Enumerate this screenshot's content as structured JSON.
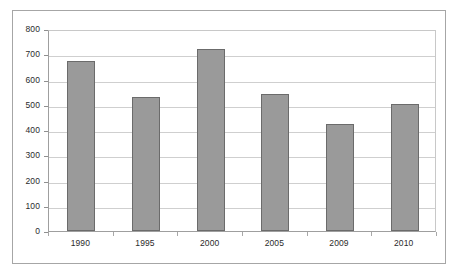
{
  "chart_data": {
    "type": "bar",
    "title": "",
    "subtitle": "",
    "xlabel": "",
    "ylabel": "",
    "categories": [
      "1990",
      "1995",
      "2000",
      "2005",
      "2009",
      "2010"
    ],
    "values": [
      675,
      530,
      720,
      543,
      425,
      505
    ],
    "series": [
      {
        "name": "",
        "values": [
          675,
          530,
          720,
          543,
          425,
          505
        ]
      }
    ],
    "ylim": [
      0,
      800
    ],
    "yticks": [
      "0",
      "100",
      "200",
      "300",
      "400",
      "500",
      "600",
      "700",
      "800"
    ],
    "ytick_values": [
      0,
      100,
      200,
      300,
      400,
      500,
      600,
      700,
      800
    ],
    "grid": "horizontal",
    "legend": "none",
    "bar_color": "#9a9a9a",
    "bar_border_color": "#6b6b6b",
    "gridline_color": "#cfcfcf",
    "axis_color": "#9f9f9f",
    "frame_color": "#a6a6a6",
    "background_color": "#ffffff",
    "text_color": "#2b2b2b"
  }
}
